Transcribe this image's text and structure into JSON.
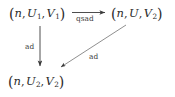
{
  "diagram": {
    "type": "commutative-diagram",
    "background_color": "#ffffff",
    "ink_color": "#2b2b2b",
    "nodes": [
      {
        "id": "top-left",
        "position": "top-left",
        "text": "(n, U_1, V_1)",
        "open_paren": "(",
        "close_paren": ")",
        "first": "n",
        "second": "U",
        "second_sub": "1",
        "third": "V",
        "third_sub": "1",
        "comma": ","
      },
      {
        "id": "top-right",
        "position": "top-right",
        "text": "(n, U, V_2)",
        "open_paren": "(",
        "close_paren": ")",
        "first": "n",
        "second": "U",
        "second_sub": "",
        "third": "V",
        "third_sub": "2",
        "comma": ","
      },
      {
        "id": "bottom-left",
        "position": "bottom-left",
        "text": "(n, U_2, V_2)",
        "open_paren": "(",
        "close_paren": ")",
        "first": "n",
        "second": "U",
        "second_sub": "2",
        "third": "V",
        "third_sub": "2",
        "comma": ","
      }
    ],
    "edges": [
      {
        "id": "top-horizontal",
        "from": "top-left",
        "to": "top-right",
        "label": "qsad",
        "direction": "right",
        "label_position": "below"
      },
      {
        "id": "left-vertical",
        "from": "top-left",
        "to": "bottom-left",
        "label": "ad",
        "direction": "down",
        "label_position": "left"
      },
      {
        "id": "diagonal",
        "from": "top-right",
        "to": "bottom-left",
        "label": "ad",
        "direction": "down-left",
        "label_position": "below-right"
      }
    ]
  }
}
